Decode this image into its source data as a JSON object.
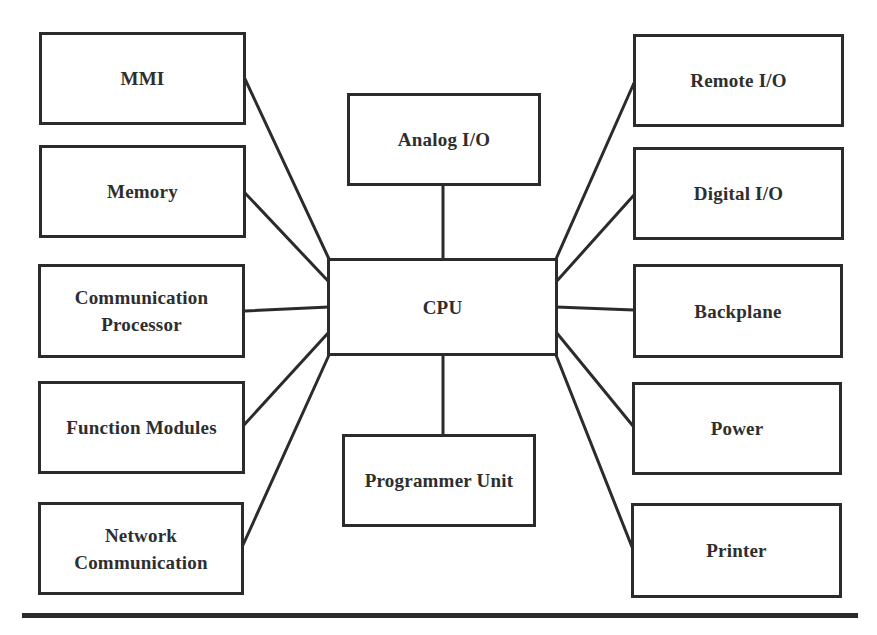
{
  "diagram": {
    "title": "",
    "center": {
      "id": "cpu",
      "label": "CPU"
    },
    "top": {
      "id": "analog-io",
      "label": "Analog I/O"
    },
    "bottom": {
      "id": "programmer-unit",
      "label": "Programmer Unit"
    },
    "left": [
      {
        "id": "mmi",
        "label": "MMI"
      },
      {
        "id": "memory",
        "label": "Memory"
      },
      {
        "id": "communication-processor",
        "label": "Communication\nProcessor"
      },
      {
        "id": "function-modules",
        "label": "Function Modules"
      },
      {
        "id": "network-communication",
        "label": "Network\nCommunication"
      }
    ],
    "right": [
      {
        "id": "remote-io",
        "label": "Remote I/O"
      },
      {
        "id": "digital-io",
        "label": "Digital I/O"
      },
      {
        "id": "backplane",
        "label": "Backplane"
      },
      {
        "id": "power",
        "label": "Power"
      },
      {
        "id": "printer",
        "label": "Printer"
      }
    ],
    "connections": [
      {
        "from": "mmi",
        "to": "cpu"
      },
      {
        "from": "memory",
        "to": "cpu"
      },
      {
        "from": "communication-processor",
        "to": "cpu"
      },
      {
        "from": "function-modules",
        "to": "cpu"
      },
      {
        "from": "network-communication",
        "to": "cpu"
      },
      {
        "from": "analog-io",
        "to": "cpu"
      },
      {
        "from": "programmer-unit",
        "to": "cpu"
      },
      {
        "from": "remote-io",
        "to": "cpu"
      },
      {
        "from": "digital-io",
        "to": "cpu"
      },
      {
        "from": "backplane",
        "to": "cpu"
      },
      {
        "from": "power",
        "to": "cpu"
      },
      {
        "from": "printer",
        "to": "cpu"
      }
    ],
    "colors": {
      "stroke": "#2b2b2b",
      "text": "#2e2e2e",
      "background": "#ffffff"
    }
  }
}
